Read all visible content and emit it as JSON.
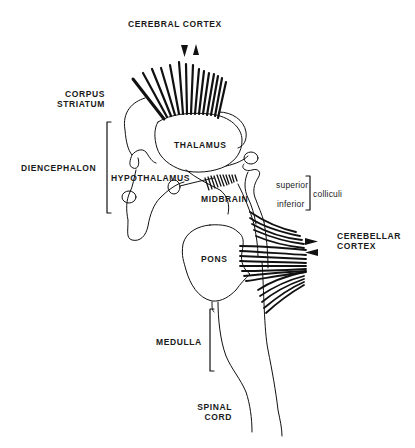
{
  "figure": {
    "type": "anatomical line drawing"
  },
  "labels": {
    "cerebral_cortex": "CEREBRAL  CORTEX",
    "corpus_striatum_line1": "CORPUS",
    "corpus_striatum_line2": "STRIATUM",
    "diencephalon": "DIENCEPHALON",
    "thalamus": "THALAMUS",
    "hypothalamus": "HYPOTHALAMUS",
    "midbrain": "MIDBRAIN",
    "superior": "superior",
    "inferior": "inferior",
    "colliculi": "colliculi",
    "cerebellar_cortex_line1": "CEREBELLAR",
    "cerebellar_cortex_line2": "CORTEX",
    "pons": "PONS",
    "medulla": "MEDULLA",
    "spinal_cord_line1": "SPINAL",
    "spinal_cord_line2": "CORD"
  },
  "colors": {
    "ink": "#111111",
    "background": "#ffffff"
  }
}
